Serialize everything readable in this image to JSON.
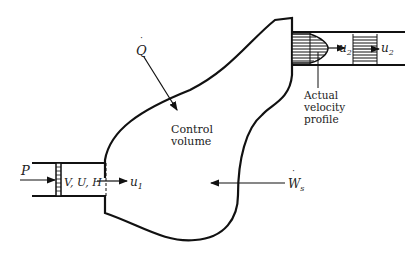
{
  "diagram": {
    "type": "control-volume-energy-balance",
    "labels": {
      "heat": "Q",
      "control_volume_line1": "Control",
      "control_volume_line2": "volume",
      "pressure": "P",
      "inlet_props": "V, U, H",
      "inlet_velocity": "u",
      "inlet_velocity_sub": "1",
      "outlet_velocity_a": "u",
      "outlet_velocity_a_sub": "2",
      "outlet_velocity_b": "u",
      "outlet_velocity_b_sub": "2",
      "shaft_work": "W",
      "shaft_work_sub": "s",
      "profile_line1": "Actual",
      "profile_line2": "velocity",
      "profile_line3": "profile"
    },
    "colors": {
      "stroke": "#111111",
      "text": "#222222",
      "background": "#ffffff"
    }
  }
}
